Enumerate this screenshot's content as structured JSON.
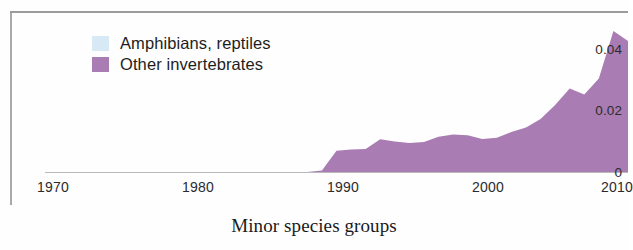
{
  "caption": "Minor species groups",
  "colors": {
    "other_invertebrates": "#a97cb3",
    "amphibians_reptiles": "#d6e9f4",
    "axis": "#b9b9b9",
    "frame": "#8b8b8b",
    "text": "#1d1d1d"
  },
  "legend": {
    "items": [
      {
        "label": "Amphibians, reptiles",
        "color": "#d6e9f4"
      },
      {
        "label": "Other invertebrates",
        "color": "#a97cb3"
      }
    ]
  },
  "axes": {
    "y_ticks": [
      "0",
      "0.02",
      "0.04"
    ],
    "x_ticks": [
      "1970",
      "1980",
      "1990",
      "2000",
      "2010"
    ]
  },
  "chart_data": {
    "type": "area",
    "title": "Minor species groups",
    "subtitle": "",
    "xlabel": "",
    "ylabel": "",
    "xlim": [
      1970,
      2010
    ],
    "ylim": [
      0,
      0.05
    ],
    "y_ticks": [
      0,
      0.02,
      0.04
    ],
    "x_ticks": [
      1970,
      1980,
      1990,
      2000,
      2010
    ],
    "grid": false,
    "legend_position": "top-left",
    "stacked": true,
    "x": [
      1970,
      1971,
      1972,
      1973,
      1974,
      1975,
      1976,
      1977,
      1978,
      1979,
      1980,
      1981,
      1982,
      1983,
      1984,
      1985,
      1986,
      1987,
      1988,
      1989,
      1990,
      1991,
      1992,
      1993,
      1994,
      1995,
      1996,
      1997,
      1998,
      1999,
      2000,
      2001,
      2002,
      2003,
      2004,
      2005,
      2006,
      2007,
      2008,
      2009,
      2010
    ],
    "series": [
      {
        "name": "Amphibians, reptiles",
        "color": "#d6e9f4",
        "values": [
          0,
          0,
          0,
          0,
          0,
          0,
          0,
          0,
          0,
          0,
          0,
          0,
          0,
          0,
          0,
          0,
          0,
          0,
          0,
          0,
          0,
          0,
          0,
          0,
          0,
          0,
          0,
          0,
          0,
          0,
          0,
          0,
          0,
          0,
          0,
          0,
          0,
          0,
          0,
          0,
          0
        ]
      },
      {
        "name": "Other invertebrates",
        "color": "#a97cb3",
        "values": [
          0,
          0,
          0,
          0,
          0,
          0,
          0,
          0,
          0,
          0,
          0,
          0,
          0,
          0,
          0,
          0,
          0,
          0,
          0,
          0.0005,
          0.0068,
          0.0072,
          0.0074,
          0.0105,
          0.0098,
          0.0093,
          0.0096,
          0.0113,
          0.012,
          0.0118,
          0.0106,
          0.011,
          0.0128,
          0.0143,
          0.017,
          0.0215,
          0.0268,
          0.0248,
          0.03,
          0.0452,
          0.042
        ]
      }
    ]
  }
}
